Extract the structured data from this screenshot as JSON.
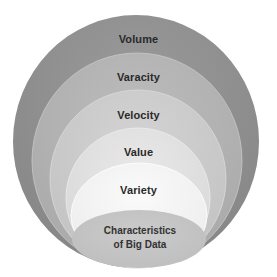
{
  "diagram": {
    "type": "nested-ellipses",
    "title": "Characteristics of Big Data",
    "layers": [
      {
        "label": "Volume",
        "fill": "#8f8f8f",
        "cx": 136,
        "cy": 141.5,
        "rx": 123,
        "ry": 126.5
      },
      {
        "label": "Varacity",
        "fill": "#b4b4b4",
        "cx": 137,
        "cy": 160.5,
        "rx": 105,
        "ry": 107.5
      },
      {
        "label": "Velocity",
        "fill": "#cbcbcb",
        "cx": 138,
        "cy": 179,
        "rx": 88,
        "ry": 89
      },
      {
        "label": "Value",
        "fill": "#e0e0e0",
        "cx": 138,
        "cy": 198,
        "rx": 72,
        "ry": 70
      },
      {
        "label": "Variety",
        "fill": "#f3f3f3",
        "cx": 139,
        "cy": 215.5,
        "rx": 68,
        "ry": 52.5
      }
    ],
    "core": {
      "line1": "Characteristics",
      "line2": "of Big Data",
      "fill": "#c4c4c4",
      "cx": 139,
      "cy": 239,
      "rx": 67,
      "ry": 29
    }
  }
}
